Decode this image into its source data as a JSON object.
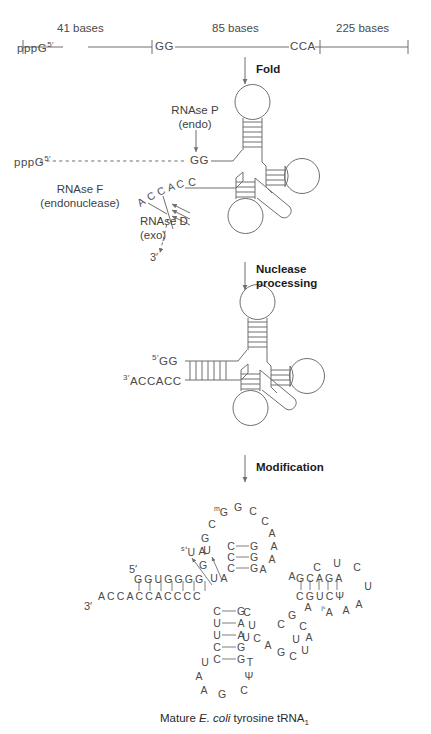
{
  "figure": {
    "caption_prefix": "Mature ",
    "caption_species": "E. coli",
    "caption_suffix": " tyrosine tRNA",
    "caption_subscript": "1",
    "caption_full": "Mature E. coli tyrosine tRNA1"
  },
  "precursor": {
    "five_prime_label": "pppG",
    "five_prime_sup": "5′",
    "segments": [
      {
        "length_label": "41 bases"
      },
      {
        "length_label": "85 bases"
      },
      {
        "length_label": "225 bases"
      }
    ],
    "marker_gg": "GG",
    "marker_cca": "CCA"
  },
  "steps": [
    {
      "label": "Fold"
    },
    {
      "label": "Nuclease\nprocessing",
      "line1": "Nuclease",
      "line2": "processing"
    },
    {
      "label": "Modification"
    }
  ],
  "enzymes": [
    {
      "name": "RNAse P",
      "type": "(endo)",
      "line1": "RNAse P",
      "line2": "(endo)"
    },
    {
      "name": "RNAse F",
      "type": "(endonuclease)",
      "line1": "RNAse F",
      "line2": "(endonuclease)"
    },
    {
      "name": "RNAse D",
      "type": "(exo)",
      "line1": "RNAse D",
      "line2": "(exo)"
    }
  ],
  "folded": {
    "five_prime_sup": "5′",
    "gg": "GG",
    "pppg": "pppG",
    "accacc_letters": [
      "A",
      "C",
      "C",
      "A",
      "C",
      "C"
    ],
    "three_prime": "3′"
  },
  "processed": {
    "five_prime_sup": "5′",
    "five_seq": "GG",
    "three_prime_sup": "3′",
    "three_seq": "ACCACC"
  },
  "mature": {
    "five_prime_label": "5′",
    "three_prime_label": "3′",
    "acceptor_five": "GGUGGGG",
    "acceptor_three": "ACCACCACCCC",
    "acceptor_pairs": 7,
    "s4u": {
      "base": "U",
      "mod": "s⁴"
    },
    "t_stem_top": "GCAGA",
    "t_stem_bottom": "CGUCΨ",
    "t_stem_pairs": 5,
    "t_loop": [
      "C",
      "U",
      "C",
      "U",
      "A",
      "A",
      "A"
    ],
    "i6a": {
      "base": "A",
      "mod": "i⁶"
    },
    "d_loop_top": [
      "mG",
      "G",
      "C",
      "C",
      "A",
      "A",
      "A",
      "A",
      "G",
      "A",
      "G",
      "C"
    ],
    "mg_mod": "m",
    "d_stem_left": [
      "C",
      "C",
      "C"
    ],
    "d_stem_right": [
      "G",
      "G",
      "G"
    ],
    "ac_stem_left": [
      "C",
      "U",
      "U",
      "C",
      "C"
    ],
    "ac_stem_right": [
      "G",
      "A",
      "A",
      "G",
      "G"
    ],
    "ac_loop": [
      "U",
      "A",
      "A",
      "G",
      "C",
      "Ψ",
      "T"
    ],
    "variable_loop": [
      "C",
      "U",
      "U",
      "C",
      "A",
      "G",
      "C",
      "U",
      "A",
      "C",
      "U",
      "G",
      "C"
    ],
    "psi": "Ψ",
    "linkers": [
      "U",
      "U",
      "A"
    ]
  },
  "colors": {
    "line": "#6f6f6f",
    "text": "#4a4a4a",
    "bold_text": "#1b1b1b",
    "background": "#ffffff"
  }
}
